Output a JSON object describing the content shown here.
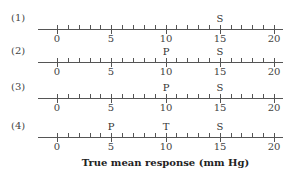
{
  "diagram": {
    "xlabel": "True mean response (mm Hg)",
    "axis_min": 0,
    "axis_max": 20,
    "major_ticks": [
      0,
      5,
      10,
      15,
      20
    ],
    "minor_step": 1,
    "rows": [
      {
        "label": "(1)",
        "markers": [
          {
            "text": "S",
            "value": 15
          }
        ]
      },
      {
        "label": "(2)",
        "markers": [
          {
            "text": "P",
            "value": 10
          },
          {
            "text": "S",
            "value": 15
          }
        ]
      },
      {
        "label": "(3)",
        "markers": [
          {
            "text": "P",
            "value": 10
          },
          {
            "text": "S",
            "value": 15
          }
        ]
      },
      {
        "label": "(4)",
        "markers": [
          {
            "text": "P",
            "value": 5
          },
          {
            "text": "T",
            "value": 10
          },
          {
            "text": "S",
            "value": 15
          }
        ]
      }
    ]
  }
}
